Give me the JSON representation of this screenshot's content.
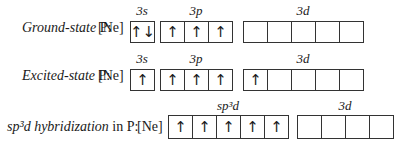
{
  "rows": [
    {
      "label_italic": "Ground-state",
      "label_rest": " P:",
      "core": "[Ne]",
      "groups": [
        {
          "name": "3s",
          "boxes": [
            "up-down"
          ]
        },
        {
          "name": "3p",
          "boxes": [
            "up",
            "up",
            "up"
          ]
        },
        {
          "name": "3d",
          "boxes": [
            "",
            "",
            "",
            "",
            ""
          ]
        }
      ]
    },
    {
      "label_italic": "Excited-state",
      "label_rest": " P:",
      "core": "[Ne]",
      "groups": [
        {
          "name": "3s",
          "boxes": [
            "up"
          ]
        },
        {
          "name": "3p",
          "boxes": [
            "up",
            "up",
            "up"
          ]
        },
        {
          "name": "3d",
          "boxes": [
            "up",
            "",
            "",
            "",
            ""
          ]
        }
      ]
    },
    {
      "label_italic": "sp³d hybridization",
      "label_rest": " in P:",
      "core": "[Ne]",
      "groups": [
        {
          "name": "sp³d",
          "boxes": [
            "up",
            "up",
            "up",
            "up",
            "up"
          ]
        },
        {
          "name": "3d",
          "boxes": [
            "",
            "",
            "",
            ""
          ]
        }
      ]
    }
  ],
  "arrow_glyphs": {
    "up": "↑",
    "up-down": "↑↓"
  }
}
